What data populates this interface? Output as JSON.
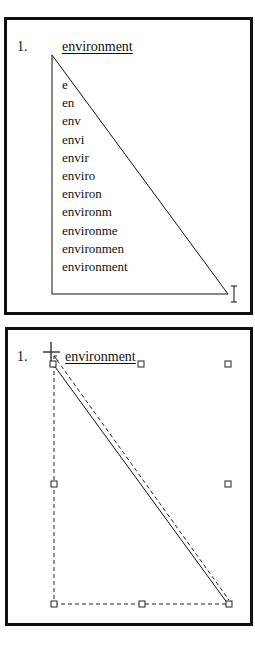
{
  "panels": [
    {
      "id": "typing-demo",
      "number_label": "1.",
      "title": "environment",
      "typed_sequence": [
        "e",
        "en",
        "env",
        "envi",
        "envir",
        "enviro",
        "environ",
        "environm",
        "environme",
        "environmen",
        "environment"
      ],
      "cursor_icon": "i-beam-cursor-icon"
    },
    {
      "id": "selection-demo",
      "number_label": "1.",
      "title": "environment",
      "cursor_icon": "crosshair-cursor-icon",
      "selection_handles": 8
    }
  ],
  "colors": {
    "ink": "#111111",
    "background": "#ffffff"
  }
}
